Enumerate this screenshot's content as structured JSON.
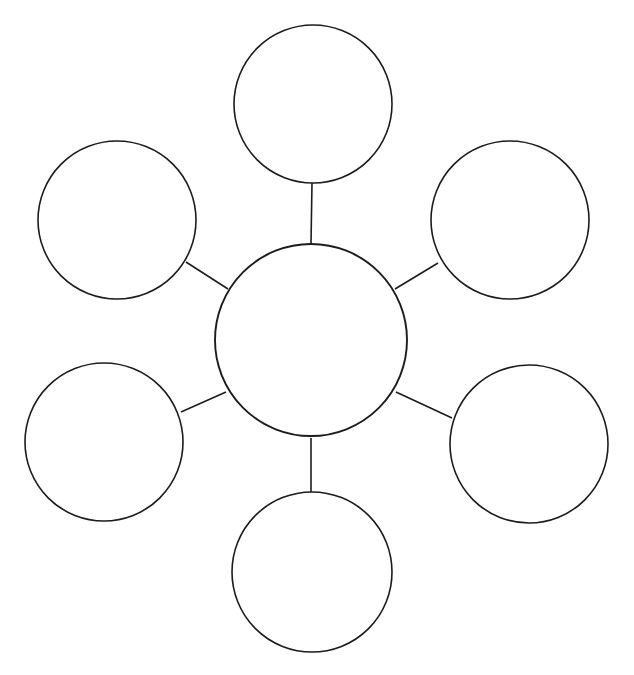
{
  "diagram": {
    "type": "bubble-map",
    "title": "",
    "canvas": {
      "width": 634,
      "height": 675,
      "background": "#ffffff"
    },
    "style": {
      "stroke_color": "#1c1c1c",
      "fill_color": "#ffffff",
      "stroke_width": 1.6,
      "center_stroke_width": 1.9
    },
    "center": {
      "label": "",
      "cx": 311,
      "cy": 340,
      "r": 96
    },
    "nodes": [
      {
        "id": "node-top",
        "label": "",
        "cx": 313,
        "cy": 104,
        "r": 79
      },
      {
        "id": "node-top-left",
        "label": "",
        "cx": 117,
        "cy": 220,
        "r": 79
      },
      {
        "id": "node-top-right",
        "label": "",
        "cx": 510,
        "cy": 220,
        "r": 79
      },
      {
        "id": "node-bottom-left",
        "label": "",
        "cx": 104,
        "cy": 442,
        "r": 79
      },
      {
        "id": "node-bottom-right",
        "label": "",
        "cx": 529,
        "cy": 444,
        "r": 79
      },
      {
        "id": "node-bottom",
        "label": "",
        "cx": 312,
        "cy": 572,
        "r": 80
      }
    ],
    "connectors": [
      {
        "id": "connector-top",
        "from": "center",
        "to": "node-top",
        "x1": 311,
        "y1": 243,
        "x2": 312,
        "y2": 183
      },
      {
        "id": "connector-top-left",
        "from": "center",
        "to": "node-top-left",
        "x1": 228,
        "y1": 289,
        "x2": 186,
        "y2": 262
      },
      {
        "id": "connector-top-right",
        "from": "center",
        "to": "node-top-right",
        "x1": 395,
        "y1": 289,
        "x2": 438,
        "y2": 263
      },
      {
        "id": "connector-bottom-left",
        "from": "center",
        "to": "node-bottom-left",
        "x1": 226,
        "y1": 392,
        "x2": 181,
        "y2": 412
      },
      {
        "id": "connector-bottom-right",
        "from": "center",
        "to": "node-bottom-right",
        "x1": 396,
        "y1": 392,
        "x2": 452,
        "y2": 418
      },
      {
        "id": "connector-bottom",
        "from": "center",
        "to": "node-bottom",
        "x1": 311,
        "y1": 438,
        "x2": 311,
        "y2": 493
      }
    ]
  }
}
